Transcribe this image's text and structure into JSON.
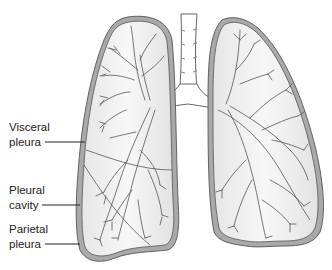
{
  "figure": {
    "colors": {
      "pleura_fill": "#a9a9a9",
      "pleura_stroke": "#555555",
      "lung_fill": "#f1f1f1",
      "airway_fill": "#ffffff",
      "airway_stroke": "#444444",
      "text": "#222222"
    }
  },
  "labels": [
    {
      "id": "visceral-pleura",
      "line1": "Visceral",
      "line2": "pleura"
    },
    {
      "id": "pleural-cavity",
      "line1": "Pleural",
      "line2": "cavity"
    },
    {
      "id": "parietal-pleura",
      "line1": "Parietal",
      "line2": "pleura"
    }
  ]
}
